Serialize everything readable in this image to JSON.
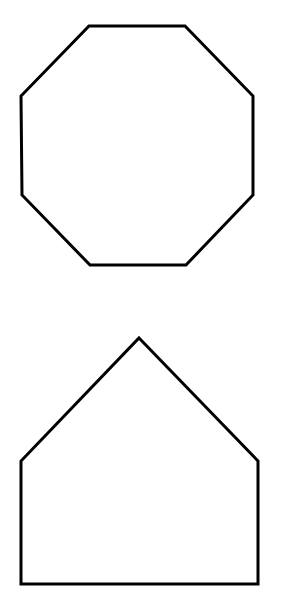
{
  "canvas": {
    "width": 288,
    "height": 594,
    "background": "#ffffff"
  },
  "style": {
    "stroke": "#000000",
    "stroke_width": 3,
    "fill": "none"
  },
  "shapes": [
    {
      "name": "octagon",
      "sides": 8,
      "points": [
        [
          89,
          26
        ],
        [
          185,
          26
        ],
        [
          253,
          96
        ],
        [
          253,
          195
        ],
        [
          186,
          265
        ],
        [
          90,
          265
        ],
        [
          22,
          195
        ],
        [
          21,
          96
        ]
      ]
    },
    {
      "name": "pentagon-house",
      "sides": 5,
      "points": [
        [
          139,
          338
        ],
        [
          258,
          461
        ],
        [
          258,
          584
        ],
        [
          21,
          584
        ],
        [
          21,
          461
        ]
      ]
    }
  ]
}
